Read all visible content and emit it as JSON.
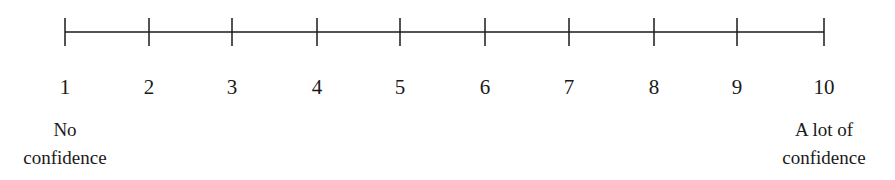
{
  "scale": {
    "min": 1,
    "max": 10,
    "ticks": [
      "1",
      "2",
      "3",
      "4",
      "5",
      "6",
      "7",
      "8",
      "9",
      "10"
    ],
    "tick_x": [
      65,
      149,
      232,
      317,
      400,
      485,
      569,
      654,
      737,
      824
    ],
    "line_color": "#1a1a1a"
  },
  "anchors": {
    "low": {
      "line1": "No",
      "line2": "confidence"
    },
    "high": {
      "line1": "A lot of",
      "line2": "confidence"
    }
  }
}
